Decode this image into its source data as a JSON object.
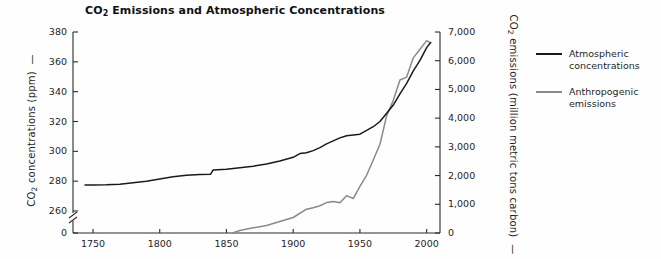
{
  "chart_data": {
    "type": "line",
    "title": "CO2 Emissions and Atmospheric Concentrations",
    "title_html": "CO<sub>2</sub> Emissions and Atmospheric Concentrations",
    "xlabel": "",
    "xlim": [
      1735,
      2010
    ],
    "x_ticks": [
      "1750",
      "1800",
      "1850",
      "1900",
      "1950",
      "2000"
    ],
    "x_tick_values": [
      1750,
      1800,
      1850,
      1900,
      1950,
      2000
    ],
    "grid": false,
    "legend_position": "right",
    "axes": {
      "left": {
        "label": "CO2 concentrations (ppm)",
        "label_html": "CO<sub>2</sub> concentrations (ppm)",
        "ticks": [
          "0",
          "260",
          "280",
          "300",
          "320",
          "340",
          "360",
          "380"
        ],
        "tick_values": [
          0,
          260,
          280,
          300,
          320,
          340,
          360,
          380
        ],
        "ylim": [
          255,
          385
        ],
        "axis_break": true,
        "axis_break_between": [
          0,
          260
        ],
        "units": "ppm"
      },
      "right": {
        "label": "CO2 emissions (million metric tons carbon)",
        "label_html": "CO<sub>2</sub> emissions (million metric tons carbon)",
        "ticks": [
          "0",
          "1,000",
          "2,000",
          "3,000",
          "4,000",
          "5,000",
          "6,000",
          "7,000"
        ],
        "tick_values": [
          0,
          1000,
          2000,
          3000,
          4000,
          5000,
          6000,
          7000
        ],
        "ylim": [
          0,
          7000
        ],
        "units": "million metric tons carbon"
      }
    },
    "series": [
      {
        "name": "Atmospheric concentrations",
        "color": "#1a1a1a",
        "axis": "left",
        "units": "ppm",
        "x": [
          1744,
          1750,
          1760,
          1770,
          1780,
          1790,
          1800,
          1810,
          1820,
          1830,
          1838,
          1840,
          1850,
          1860,
          1870,
          1880,
          1890,
          1900,
          1905,
          1910,
          1915,
          1920,
          1925,
          1930,
          1935,
          1940,
          1945,
          1950,
          1955,
          1960,
          1965,
          1970,
          1975,
          1980,
          1985,
          1990,
          1995,
          2000,
          2003
        ],
        "y": [
          277.5,
          277.5,
          277.6,
          278.0,
          279.0,
          280.0,
          281.5,
          283.0,
          284.0,
          284.5,
          284.6,
          287.5,
          288.0,
          289.0,
          290.0,
          291.5,
          293.5,
          296.0,
          298.5,
          299.0,
          300.5,
          302.5,
          305.0,
          307.0,
          309.0,
          310.5,
          311.0,
          311.5,
          314.0,
          316.5,
          320.0,
          325.5,
          331.0,
          338.5,
          345.5,
          354.0,
          361.0,
          369.5,
          373.0
        ]
      },
      {
        "name": "Anthropogenic emissions",
        "color": "#8a8a8a",
        "axis": "right",
        "units": "million metric tons carbon",
        "x": [
          1855,
          1860,
          1870,
          1880,
          1890,
          1900,
          1910,
          1915,
          1920,
          1925,
          1930,
          1935,
          1940,
          1945,
          1950,
          1955,
          1960,
          1965,
          1970,
          1975,
          1980,
          1985,
          1990,
          1995,
          2000,
          2002
        ],
        "y": [
          10,
          90,
          180,
          260,
          400,
          540,
          830,
          880,
          950,
          1060,
          1100,
          1050,
          1300,
          1200,
          1620,
          2010,
          2540,
          3090,
          4080,
          4620,
          5330,
          5430,
          6100,
          6400,
          6700,
          6650
        ]
      }
    ],
    "crossover_note": "Curves cross at approximately 1975"
  },
  "legend": {
    "items": [
      {
        "label_line1": "Atmospheric",
        "label_line2": "concentrations",
        "color": "#1a1a1a"
      },
      {
        "label_line1": "Anthropogenic",
        "label_line2": "emissions",
        "color": "#8a8a8a"
      }
    ]
  }
}
